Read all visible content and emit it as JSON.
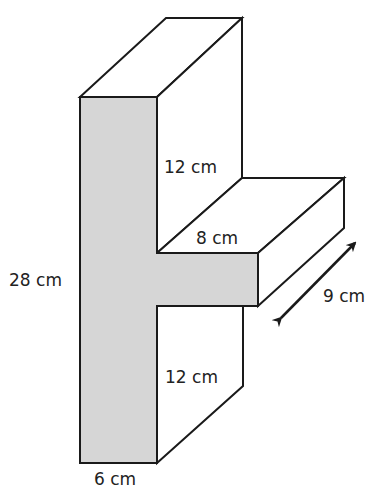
{
  "diagram": {
    "type": "3D prism (T-shaped cross-section)",
    "fill_color": "#d6d6d6",
    "line_color": "#1a1a1a",
    "labels": {
      "height_total": "28 cm",
      "upper_height": "12 cm",
      "arm_width": "8 cm",
      "depth": "9 cm",
      "lower_height": "12 cm",
      "stem_width": "6 cm"
    }
  }
}
